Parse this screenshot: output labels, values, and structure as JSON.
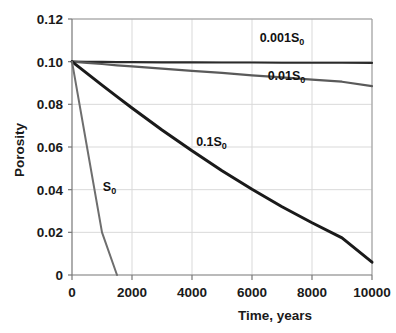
{
  "chart_data": {
    "type": "line",
    "title": "",
    "xlabel": "Time, years",
    "ylabel": "Porosity",
    "xlim": [
      0,
      10000
    ],
    "ylim": [
      0,
      0.12
    ],
    "xticks": [
      "0",
      "2000",
      "4000",
      "6000",
      "8000",
      "10000"
    ],
    "xtick_values": [
      0,
      2000,
      4000,
      6000,
      8000,
      10000
    ],
    "yticks": [
      "0",
      "0.02",
      "0.04",
      "0.06",
      "0.08",
      "0.10",
      "0.12"
    ],
    "ytick_values": [
      0,
      0.02,
      0.04,
      0.06,
      0.08,
      0.1,
      0.12
    ],
    "grid": true,
    "legend_position": "inline-annotations",
    "x": [
      0,
      500,
      1000,
      1500,
      2000,
      3000,
      4000,
      5000,
      6000,
      7000,
      8000,
      9000,
      10000
    ],
    "series": [
      {
        "name": "0.001S0",
        "label": "0.001S",
        "label_sub": "0",
        "color": "#2b2b2b",
        "width": 2.2,
        "values": [
          0.1,
          0.0999,
          0.0999,
          0.0998,
          0.0998,
          0.0997,
          0.0997,
          0.0996,
          0.0996,
          0.0995,
          0.0995,
          0.0995,
          0.0994
        ]
      },
      {
        "name": "0.01S0",
        "label": "0.01S",
        "label_sub": "0",
        "color": "#5a5a5a",
        "width": 2.2,
        "values": [
          0.1,
          0.0994,
          0.0989,
          0.0983,
          0.0978,
          0.0967,
          0.0957,
          0.0947,
          0.0936,
          0.0926,
          0.0916,
          0.0906,
          0.0885
        ]
      },
      {
        "name": "0.1S0",
        "label": "0.1S",
        "label_sub": "0",
        "color": "#1a1a1a",
        "width": 3.0,
        "values": [
          0.1,
          0.0945,
          0.089,
          0.0836,
          0.0783,
          0.068,
          0.0582,
          0.0489,
          0.0402,
          0.032,
          0.0245,
          0.0174,
          0.006
        ]
      },
      {
        "name": "S0",
        "label": "S",
        "label_sub": "0",
        "color": "#6e6e6e",
        "width": 2.0,
        "values": [
          0.1,
          0.06,
          0.02,
          0.0,
          null,
          null,
          null,
          null,
          null,
          null,
          null,
          null,
          null
        ]
      }
    ],
    "annotations": [
      {
        "text": "0.001S",
        "sub": "0",
        "x": 7000,
        "y": 0.109
      },
      {
        "text": "0.01S",
        "sub": "0",
        "x": 7150,
        "y": 0.0915
      },
      {
        "text": "0.1S",
        "sub": "0",
        "x": 4650,
        "y": 0.0605
      },
      {
        "text": "S",
        "sub": "0",
        "x": 1250,
        "y": 0.0395
      }
    ],
    "colors": {
      "axis": "#808080",
      "grid": "#d9d9d9",
      "text": "#1a1a1a",
      "background": "#ffffff"
    }
  }
}
